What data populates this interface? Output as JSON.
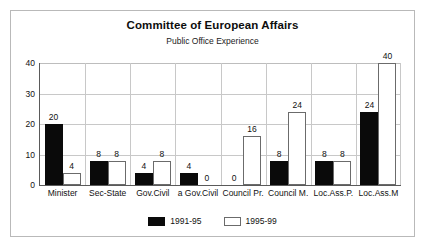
{
  "chart_data": {
    "type": "bar",
    "title": "Committee of European Affairs",
    "subtitle": "Public Office Experience",
    "xlabel": "",
    "ylabel": "",
    "ylim": [
      0,
      40
    ],
    "yticks": [
      0,
      10,
      20,
      30,
      40
    ],
    "grid": true,
    "legend_position": "bottom",
    "categories": [
      "Minister",
      "Sec-State",
      "Gov.Civil",
      "a Gov.Civil",
      "Council Pr.",
      "Council M.",
      "Loc.Ass.P.",
      "Loc.Ass.M"
    ],
    "series": [
      {
        "name": "1991-95",
        "color": "#0a0a0a",
        "values": [
          20,
          8,
          4,
          4,
          0,
          8,
          8,
          24
        ]
      },
      {
        "name": "1995-99",
        "color": "#ffffff",
        "values": [
          4,
          8,
          8,
          0,
          16,
          24,
          8,
          40
        ]
      }
    ],
    "data_labels": [
      [
        "20",
        "8",
        "4",
        "4",
        "0",
        "8",
        "8",
        "24"
      ],
      [
        "4",
        "8",
        "8",
        "0",
        "16",
        "24",
        "8",
        "40"
      ]
    ]
  }
}
